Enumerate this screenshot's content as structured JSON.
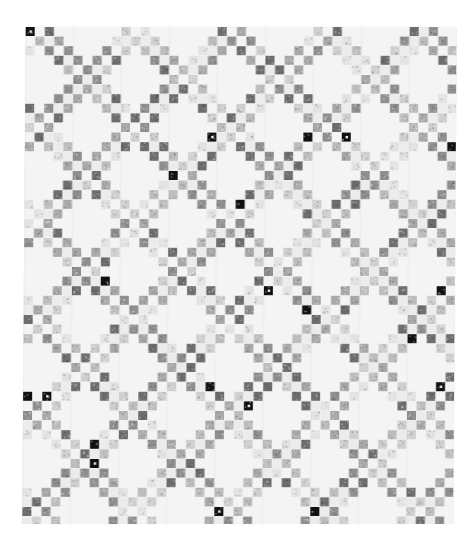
{
  "image": {
    "subject": "Black-and-white photograph of a patchwork quilt",
    "pattern": "Irish chain / diagonal nine-patch lattice of small printed squares on a white ground",
    "background_color": "#ffffff",
    "quilt_ground_color": "#f4f4f4",
    "patch_tones": [
      "#e2e2e2",
      "#cfcfcf",
      "#bdbdbd",
      "#a8a8a8",
      "#8f8f8f",
      "#6e6e6e",
      "#111111"
    ],
    "quilt_bounds": {
      "left": 24,
      "top": 27,
      "right": 455,
      "bottom": 524
    },
    "cell_size_px": 9.6,
    "lattice_period_cells": 10
  }
}
